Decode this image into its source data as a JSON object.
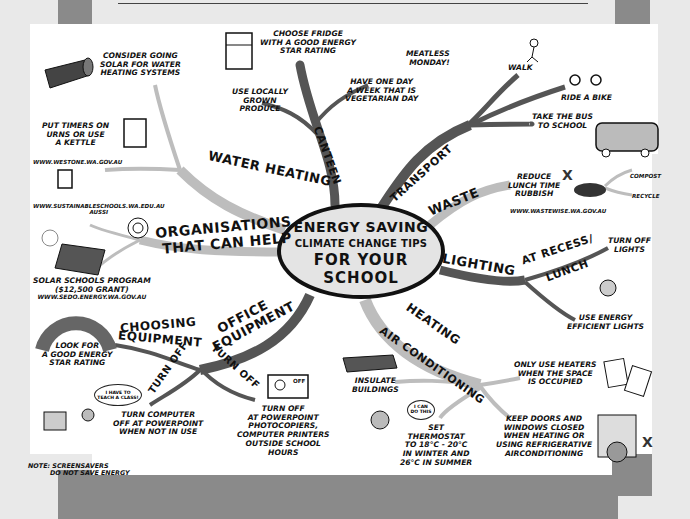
{
  "title": {
    "line1": "ENERGY SAVING",
    "line2": "CLIMATE CHANGE TIPS",
    "line3": "FOR YOUR",
    "line4": "SCHOOL"
  },
  "colors": {
    "background": "#e9e9e9",
    "frame_gray": "#8a8a8a",
    "sheet": "#ffffff",
    "dark_branch": "#555555",
    "light_branch": "#bdbdbd",
    "center_fill": "#e4e4e4",
    "ink": "#111111"
  },
  "branches": {
    "water_heating": {
      "label": "WATER HEATING",
      "tips": [
        "CONSIDER GOING SOLAR FOR WATER HEATING SYSTEMS",
        "PUT TIMERS ON URNS OR USE A KETTLE"
      ],
      "solar_tip": [
        "CONSIDER GOING",
        "SOLAR FOR WATER",
        "HEATING SYSTEMS"
      ],
      "timer_tip": [
        "PUT TIMERS ON",
        "URNS OR USE",
        "A KETTLE"
      ],
      "url": "WWW.WESTONE.WA.GOV.AU"
    },
    "canteen": {
      "label": "CANTEEN",
      "fridge_tip": [
        "CHOOSE FRIDGE",
        "WITH A GOOD ENERGY",
        "STAR RATING"
      ],
      "local_tip": [
        "USE LOCALLY",
        "GROWN",
        "PRODUCE"
      ],
      "meatless": [
        "MEATLESS",
        "MONDAY!"
      ],
      "veg_day": [
        "HAVE ONE DAY",
        "A WEEK THAT IS",
        "VEGETARIAN DAY"
      ]
    },
    "transport": {
      "label": "TRANSPORT",
      "tips": [
        "WALK",
        "RIDE A BIKE"
      ],
      "bus": [
        "TAKE THE BUS",
        "TO SCHOOL"
      ]
    },
    "waste": {
      "label": "WASTE",
      "tip": [
        "REDUCE",
        "LUNCH TIME",
        "RUBBISH"
      ],
      "url": "WWW.WASTEWISE.WA.GOV.AU",
      "options": [
        "COMPOST",
        "RECYCLE"
      ]
    },
    "lighting": {
      "label": "LIGHTING",
      "sub_label": [
        "AT RECESS/",
        "LUNCH"
      ],
      "turn_off": [
        "TURN OFF",
        "LIGHTS"
      ],
      "efficient": [
        "USE ENERGY",
        "EFFICIENT LIGHTS"
      ]
    },
    "heating": {
      "label_line1": "HEATING",
      "label_line2": "AIR CONDITIONING",
      "insulate": [
        "INSULATE",
        "BUILDINGS"
      ],
      "heaters": [
        "ONLY USE HEATERS",
        "WHEN THE SPACE",
        "IS OCCUPIED"
      ],
      "thermostat": [
        "SET",
        "THERMOSTAT",
        "TO 18°C - 20°C",
        "IN WINTER AND",
        "26°C IN SUMMER"
      ],
      "doors": [
        "KEEP DOORS AND",
        "WINDOWS CLOSED",
        "WHEN HEATING OR",
        "USING REFRIGERATIVE",
        "AIRCONDITIONING"
      ],
      "speech_bubble": [
        "I CAN",
        "DO THIS"
      ],
      "bill_then": [
        "THEN",
        "POWER BILL",
        "$170"
      ],
      "bill_now": [
        "NOW",
        "POWER BILL",
        "$40"
      ]
    },
    "office_equipment": {
      "label_line1": "OFFICE",
      "label_line2": "EQUIPMENT",
      "choosing": [
        "CHOOSING",
        "EQUIPMENT"
      ],
      "look_for": [
        "LOOK FOR",
        "A GOOD ENERGY",
        "STAR RATING"
      ],
      "turn_off_label": "TURN OFF",
      "turn_off_label_2": "TURN OFF",
      "computer_tip": [
        "TURN COMPUTER",
        "OFF AT POWERPOINT",
        "WHEN NOT IN USE"
      ],
      "powerpoint_tip": [
        "TURN OFF",
        "AT POWERPOINT",
        "PHOTOCOPIERS,",
        "COMPUTER PRINTERS",
        "OUTSIDE SCHOOL",
        "HOURS"
      ],
      "note": [
        "NOTE: SCREENSAVERS",
        "DO NOT SAVE ENERGY"
      ],
      "speech_bubble": [
        "I HAVE TO",
        "TEACH A CLASS!"
      ],
      "switch_label": "OFF"
    },
    "organisations": {
      "label_line1": "ORGANISATIONS",
      "label_line2": "THAT CAN HELP",
      "aussi": [
        "WWW.SUSTAINABLESCHOOLS.WA.EDU.AU",
        "AUSSI"
      ],
      "solar_program": [
        "SOLAR SCHOOLS PROGRAM",
        "($12,500 GRANT)",
        "WWW.SEDO.ENERGY.WA.GOV.AU"
      ]
    }
  }
}
